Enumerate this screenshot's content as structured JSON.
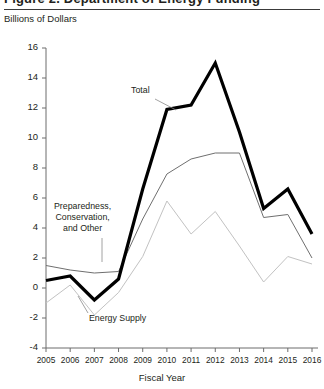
{
  "figure": {
    "title_partial": "Figure 2. Department of Energy Funding",
    "y_axis_title": "Billions of Dollars",
    "x_axis_title": "Fiscal Year"
  },
  "annotations": [
    {
      "name": "total",
      "text": "Total"
    },
    {
      "name": "preparedness",
      "line1": "Preparedness,",
      "line2": "Conservation,",
      "line3": "and Other"
    },
    {
      "name": "energy-supply",
      "text": "Energy Supply"
    }
  ],
  "chart_data": {
    "type": "line",
    "title": "Department of Energy Funding",
    "xlabel": "Fiscal Year",
    "ylabel": "Billions of Dollars",
    "categories": [
      2005,
      2006,
      2007,
      2008,
      2009,
      2010,
      2011,
      2012,
      2013,
      2014,
      2015,
      2016
    ],
    "x": [
      "2005",
      "2006",
      "2007",
      "2008",
      "2009",
      "2010",
      "2011",
      "2012",
      "2013",
      "2014",
      "2015",
      "2016"
    ],
    "xlim": [
      2005,
      2016
    ],
    "ylim": [
      -4,
      16
    ],
    "yticks": [
      -4,
      -2,
      0,
      2,
      4,
      6,
      8,
      10,
      12,
      14,
      16
    ],
    "grid": false,
    "legend": "inline-annotations",
    "series": [
      {
        "name": "Total",
        "color": "#000000",
        "width": 3.2,
        "values": [
          0.5,
          0.8,
          -0.8,
          0.6,
          6.6,
          11.9,
          12.2,
          15.0,
          10.4,
          5.3,
          6.6,
          3.6
        ]
      },
      {
        "name": "Preparedness, Conservation, and Other",
        "color": "#6f6f6f",
        "width": 1.0,
        "values": [
          1.5,
          1.2,
          1.0,
          1.1,
          4.6,
          7.6,
          8.6,
          9.0,
          9.0,
          4.7,
          4.9,
          2.0
        ]
      },
      {
        "name": "Energy Supply",
        "color": "#c2c2c2",
        "width": 1.0,
        "values": [
          -1.0,
          0.2,
          -1.8,
          -0.3,
          2.1,
          5.8,
          3.6,
          5.1,
          2.8,
          0.4,
          2.1,
          1.6
        ]
      }
    ]
  }
}
